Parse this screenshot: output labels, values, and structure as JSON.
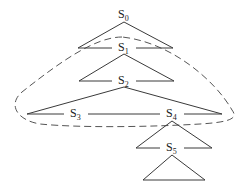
{
  "diagram": {
    "type": "tree-of-triangles",
    "nodes": [
      {
        "id": "S0",
        "base": "S",
        "sub": "0"
      },
      {
        "id": "S1",
        "base": "S",
        "sub": "1"
      },
      {
        "id": "S2",
        "base": "S",
        "sub": "2"
      },
      {
        "id": "S3",
        "base": "S",
        "sub": "3"
      },
      {
        "id": "S4",
        "base": "S",
        "sub": "4"
      },
      {
        "id": "S5",
        "base": "S",
        "sub": "5"
      }
    ],
    "triangles": [
      {
        "apex": "S0",
        "children": [
          "S1"
        ]
      },
      {
        "apex": "S1",
        "children": [
          "S2"
        ]
      },
      {
        "apex": "S2",
        "children": [
          "S3",
          "S4"
        ]
      },
      {
        "apex": "S4",
        "children": [
          "S5"
        ]
      },
      {
        "apex": "S5",
        "children": []
      }
    ],
    "dashed_region": {
      "encloses": [
        "S1",
        "S2",
        "S3",
        "S4"
      ],
      "style": "dashed"
    },
    "colors": {
      "line": "#3a3a3a",
      "dash": "#555555",
      "background": "#ffffff"
    }
  }
}
